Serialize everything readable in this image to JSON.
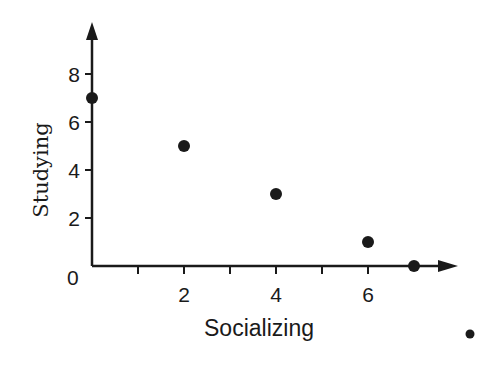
{
  "chart_data": {
    "type": "scatter",
    "title": "",
    "xlabel": "Socializing",
    "ylabel": "Studying",
    "x_ticks": [
      1,
      2,
      3,
      4,
      5,
      6
    ],
    "x_tick_labels": [
      "2",
      "4",
      "6"
    ],
    "x_tick_label_values": [
      2,
      4,
      6
    ],
    "y_ticks": [
      2,
      4,
      6,
      8
    ],
    "y_tick_labels": [
      "2",
      "4",
      "6",
      "8"
    ],
    "origin_label": "0",
    "xlim": [
      0,
      8
    ],
    "ylim": [
      0,
      9
    ],
    "grid": false,
    "legend": null,
    "points": [
      {
        "x": 0,
        "y": 7
      },
      {
        "x": 2,
        "y": 5
      },
      {
        "x": 4,
        "y": 3
      },
      {
        "x": 6,
        "y": 1
      },
      {
        "x": 7,
        "y": 0
      }
    ],
    "extra_marks": [
      {
        "description": "stray dot outside plot area",
        "px": 470,
        "py": 334
      }
    ],
    "colors": {
      "ink": "#1a1a1a",
      "background": "#ffffff"
    }
  }
}
